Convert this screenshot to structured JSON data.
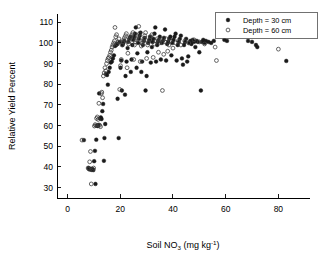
{
  "chart_data": {
    "type": "scatter",
    "title": "",
    "xlabel": "Soil NO3 (mg kg-1)",
    "xlabel_parts": {
      "base1": "Soil NO",
      "sub": "3",
      "base2": " (mg kg",
      "sup": "-1",
      "base3": ")"
    },
    "ylabel": "Relative Yield Percent",
    "xlim": [
      -4,
      92
    ],
    "ylim": [
      25,
      114
    ],
    "xticks": [
      0,
      20,
      40,
      60,
      80
    ],
    "yticks": [
      30,
      40,
      50,
      60,
      70,
      80,
      90,
      100,
      110
    ],
    "grid": false,
    "legend_position": "top-right",
    "series": [
      {
        "name": "Depth = 30 cm",
        "marker": "filled-circle",
        "color": "#1a1a1a",
        "points": [
          [
            6.2,
            53.0
          ],
          [
            8.0,
            39.5
          ],
          [
            8.3,
            39.0
          ],
          [
            8.6,
            38.8
          ],
          [
            8.9,
            39.2
          ],
          [
            9.2,
            38.6
          ],
          [
            9.5,
            39.0
          ],
          [
            9.8,
            38.5
          ],
          [
            10.1,
            42.8
          ],
          [
            10.4,
            47.8
          ],
          [
            10.6,
            31.8
          ],
          [
            10.9,
            53.2
          ],
          [
            11.2,
            60.0
          ],
          [
            11.5,
            59.8
          ],
          [
            11.8,
            60.4
          ],
          [
            12.0,
            75.6
          ],
          [
            12.3,
            63.5
          ],
          [
            12.6,
            64.0
          ],
          [
            12.9,
            63.2
          ],
          [
            13.2,
            67.0
          ],
          [
            13.5,
            70.5
          ],
          [
            13.8,
            43.0
          ],
          [
            14.0,
            54.0
          ],
          [
            14.3,
            60.8
          ],
          [
            14.6,
            85.0
          ],
          [
            15.0,
            84.5
          ],
          [
            15.3,
            79.8
          ],
          [
            15.6,
            86.0
          ],
          [
            16.0,
            88.0
          ],
          [
            16.4,
            90.5
          ],
          [
            16.8,
            91.0
          ],
          [
            17.2,
            92.5
          ],
          [
            17.6,
            94.0
          ],
          [
            18.0,
            98.5
          ],
          [
            18.4,
            99.0
          ],
          [
            18.8,
            99.5
          ],
          [
            19.0,
            73.0
          ],
          [
            19.4,
            54.0
          ],
          [
            19.8,
            100.5
          ],
          [
            20.1,
            88.0
          ],
          [
            20.4,
            91.5
          ],
          [
            20.6,
            77.0
          ],
          [
            20.9,
            99.0
          ],
          [
            21.2,
            100.0
          ],
          [
            21.5,
            101.0
          ],
          [
            21.8,
            75.0
          ],
          [
            22.0,
            84.0
          ],
          [
            22.4,
            91.0
          ],
          [
            22.8,
            97.5
          ],
          [
            23.0,
            100.5
          ],
          [
            23.4,
            102.0
          ],
          [
            23.8,
            103.0
          ],
          [
            24.0,
            86.0
          ],
          [
            24.3,
            92.0
          ],
          [
            24.6,
            99.0
          ],
          [
            25.0,
            101.5
          ],
          [
            25.3,
            103.0
          ],
          [
            25.6,
            104.5
          ],
          [
            25.9,
            107.5
          ],
          [
            26.2,
            88.0
          ],
          [
            26.5,
            95.0
          ],
          [
            26.8,
            100.0
          ],
          [
            27.1,
            102.0
          ],
          [
            27.4,
            103.5
          ],
          [
            27.7,
            105.0
          ],
          [
            28.0,
            86.0
          ],
          [
            28.3,
            91.0
          ],
          [
            28.6,
            99.0
          ],
          [
            29.0,
            101.0
          ],
          [
            29.3,
            102.5
          ],
          [
            29.6,
            77.0
          ],
          [
            30.0,
            84.0
          ],
          [
            30.3,
            95.5
          ],
          [
            30.6,
            100.0
          ],
          [
            31.0,
            101.5
          ],
          [
            31.3,
            103.0
          ],
          [
            31.6,
            90.5
          ],
          [
            32.0,
            98.0
          ],
          [
            32.3,
            100.5
          ],
          [
            32.6,
            102.0
          ],
          [
            33.0,
            104.5
          ],
          [
            33.3,
            107.5
          ],
          [
            33.6,
            91.0
          ],
          [
            34.0,
            99.0
          ],
          [
            34.3,
            100.5
          ],
          [
            34.6,
            101.5
          ],
          [
            35.0,
            103.0
          ],
          [
            35.4,
            92.0
          ],
          [
            35.8,
            100.0
          ],
          [
            36.2,
            101.0
          ],
          [
            36.6,
            102.5
          ],
          [
            37.0,
            106.5
          ],
          [
            37.4,
            91.5
          ],
          [
            37.8,
            99.5
          ],
          [
            38.2,
            100.5
          ],
          [
            38.6,
            102.0
          ],
          [
            39.0,
            103.0
          ],
          [
            39.4,
            94.0
          ],
          [
            39.8,
            100.0
          ],
          [
            40.2,
            101.5
          ],
          [
            40.6,
            103.0
          ],
          [
            41.0,
            104.5
          ],
          [
            41.4,
            91.5
          ],
          [
            41.8,
            99.0
          ],
          [
            42.2,
            100.5
          ],
          [
            42.6,
            102.0
          ],
          [
            43.0,
            103.5
          ],
          [
            43.4,
            92.5
          ],
          [
            43.8,
            89.5
          ],
          [
            44.2,
            99.0
          ],
          [
            44.6,
            100.5
          ],
          [
            45.0,
            102.0
          ],
          [
            45.4,
            91.0
          ],
          [
            45.8,
            93.5
          ],
          [
            46.2,
            100.0
          ],
          [
            46.6,
            101.0
          ],
          [
            47.0,
            99.5
          ],
          [
            47.5,
            101.5
          ],
          [
            48.0,
            100.5
          ],
          [
            48.5,
            98.0
          ],
          [
            49.0,
            101.0
          ],
          [
            49.5,
            100.5
          ],
          [
            50.0,
            95.5
          ],
          [
            50.6,
            77.0
          ],
          [
            51.0,
            100.5
          ],
          [
            51.5,
            101.5
          ],
          [
            52.0,
            100.0
          ],
          [
            52.5,
            101.0
          ],
          [
            53.5,
            100.5
          ],
          [
            54.5,
            100.0
          ],
          [
            55.5,
            101.0
          ],
          [
            59.5,
            101.5
          ],
          [
            60.5,
            101.0
          ],
          [
            68.5,
            101.0
          ],
          [
            70.0,
            100.5
          ],
          [
            71.5,
            99.0
          ],
          [
            72.0,
            98.0
          ],
          [
            83.0,
            91.3
          ]
        ]
      },
      {
        "name": "Depth = 60 cm",
        "marker": "open-circle",
        "color": "#3d3d3d",
        "points": [
          [
            5.5,
            53.0
          ],
          [
            7.8,
            39.5
          ],
          [
            8.1,
            39.0
          ],
          [
            8.4,
            42.5
          ],
          [
            8.7,
            47.5
          ],
          [
            9.0,
            31.8
          ],
          [
            9.6,
            38.8
          ],
          [
            9.9,
            39.5
          ],
          [
            10.2,
            59.8
          ],
          [
            10.5,
            60.5
          ],
          [
            10.8,
            60.0
          ],
          [
            11.0,
            63.5
          ],
          [
            11.3,
            64.2
          ],
          [
            11.6,
            63.0
          ],
          [
            11.9,
            70.8
          ],
          [
            12.2,
            60.2
          ],
          [
            12.5,
            59.5
          ],
          [
            12.8,
            75.5
          ],
          [
            13.0,
            76.2
          ],
          [
            13.3,
            73.5
          ],
          [
            13.6,
            84.0
          ],
          [
            13.9,
            85.5
          ],
          [
            14.2,
            88.0
          ],
          [
            14.5,
            86.5
          ],
          [
            14.8,
            90.0
          ],
          [
            15.1,
            91.5
          ],
          [
            15.4,
            92.5
          ],
          [
            15.7,
            93.0
          ],
          [
            16.0,
            94.0
          ],
          [
            16.3,
            95.5
          ],
          [
            16.6,
            96.5
          ],
          [
            16.9,
            98.0
          ],
          [
            17.2,
            99.0
          ],
          [
            17.5,
            100.0
          ],
          [
            17.8,
            101.0
          ],
          [
            18.0,
            107.5
          ],
          [
            18.3,
            103.0
          ],
          [
            18.6,
            104.0
          ],
          [
            18.9,
            99.5
          ],
          [
            19.2,
            100.5
          ],
          [
            19.5,
            102.0
          ],
          [
            19.8,
            77.5
          ],
          [
            20.1,
            89.0
          ],
          [
            20.4,
            92.0
          ],
          [
            20.7,
            99.0
          ],
          [
            21.0,
            100.5
          ],
          [
            21.3,
            101.5
          ],
          [
            21.6,
            102.5
          ],
          [
            22.0,
            103.5
          ],
          [
            22.3,
            104.5
          ],
          [
            22.6,
            88.0
          ],
          [
            22.9,
            95.0
          ],
          [
            23.2,
            99.5
          ],
          [
            23.5,
            101.0
          ],
          [
            23.8,
            102.0
          ],
          [
            24.1,
            103.0
          ],
          [
            24.4,
            104.0
          ],
          [
            24.8,
            105.0
          ],
          [
            25.1,
            92.0
          ],
          [
            25.4,
            99.0
          ],
          [
            25.7,
            100.5
          ],
          [
            26.0,
            101.5
          ],
          [
            26.3,
            102.5
          ],
          [
            26.6,
            103.5
          ],
          [
            27.0,
            108.0
          ],
          [
            27.3,
            104.5
          ],
          [
            27.6,
            91.0
          ],
          [
            28.0,
            98.5
          ],
          [
            28.3,
            100.0
          ],
          [
            28.6,
            101.0
          ],
          [
            29.0,
            102.0
          ],
          [
            29.3,
            103.5
          ],
          [
            29.6,
            105.0
          ],
          [
            30.0,
            92.5
          ],
          [
            30.4,
            99.0
          ],
          [
            30.8,
            100.5
          ],
          [
            31.2,
            101.5
          ],
          [
            31.6,
            103.0
          ],
          [
            32.0,
            104.0
          ],
          [
            32.5,
            93.0
          ],
          [
            33.0,
            99.5
          ],
          [
            33.5,
            101.0
          ],
          [
            34.0,
            102.0
          ],
          [
            34.5,
            95.5
          ],
          [
            35.0,
            100.0
          ],
          [
            35.5,
            101.5
          ],
          [
            36.0,
            77.0
          ],
          [
            36.5,
            94.5
          ],
          [
            37.0,
            100.5
          ],
          [
            37.5,
            102.0
          ],
          [
            38.0,
            96.0
          ],
          [
            38.5,
            99.0
          ],
          [
            39.0,
            101.0
          ],
          [
            40.0,
            97.5
          ],
          [
            41.0,
            100.0
          ],
          [
            42.0,
            101.0
          ],
          [
            43.0,
            99.0
          ],
          [
            44.5,
            101.0
          ],
          [
            46.0,
            100.0
          ],
          [
            48.0,
            101.5
          ],
          [
            50.0,
            100.5
          ],
          [
            52.0,
            99.5
          ],
          [
            56.0,
            98.0
          ],
          [
            56.5,
            91.5
          ],
          [
            80.0,
            97.0
          ]
        ]
      }
    ]
  },
  "legend": {
    "entries": [
      {
        "label": "Depth = 30 cm",
        "marker": "filled-circle"
      },
      {
        "label": "Depth = 60 cm",
        "marker": "open-circle"
      }
    ]
  },
  "axes": {
    "x_tick_labels": [
      "0",
      "20",
      "40",
      "60",
      "80"
    ],
    "y_tick_labels": [
      "30",
      "40",
      "50",
      "60",
      "70",
      "80",
      "90",
      "100",
      "110"
    ],
    "y_title": "Relative Yield Percent"
  },
  "colors": {
    "filled_marker": "#1a1a1a",
    "open_marker": "#3d3d3d",
    "axis": "#000000",
    "background": "#ffffff"
  }
}
